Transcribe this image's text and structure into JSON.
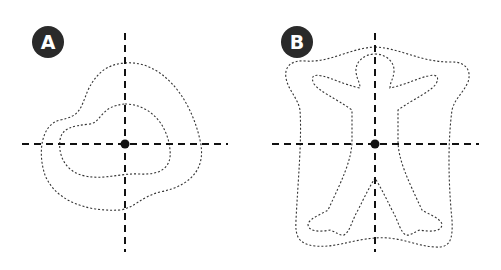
{
  "panels": [
    {
      "label": "A",
      "shape": "irregular-blob",
      "contours": 2,
      "description": "Two nested dotted contours around a center point with dashed crosshair axes"
    },
    {
      "label": "B",
      "shape": "human-figure",
      "contours": 2,
      "description": "Human figure silhouette with arms raised and outer offset contour, dashed crosshair axes through center point"
    }
  ],
  "colors": {
    "badge_bg": "#2a2a2a",
    "badge_text": "#ffffff",
    "line": "#111111",
    "contour": "#333333"
  }
}
